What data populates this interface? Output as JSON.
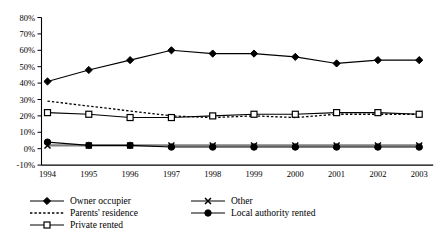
{
  "chart_data": {
    "type": "line",
    "title": "",
    "subtitle": "",
    "xlabel": "",
    "ylabel": "",
    "x": [
      "1994",
      "1995",
      "1996",
      "1997",
      "1998",
      "1999",
      "2000",
      "2001",
      "2002",
      "2003"
    ],
    "categories": [
      "1994",
      "1995",
      "1996",
      "1997",
      "1998",
      "1999",
      "2000",
      "2001",
      "2002",
      "2003"
    ],
    "ylim": [
      -10,
      80
    ],
    "ytick_labels": [
      "80%",
      "70%",
      "60%",
      "50%",
      "40%",
      "30%",
      "20%",
      "10%",
      "0%",
      "-10%"
    ],
    "ytick_values": [
      80,
      70,
      60,
      50,
      40,
      30,
      20,
      10,
      0,
      -10
    ],
    "grid": false,
    "legend_position": "bottom",
    "series": [
      {
        "name": "Owner occupier",
        "marker": "filled-diamond",
        "line_style": "solid",
        "color": "#000000",
        "values": [
          41,
          48,
          54,
          60,
          58,
          58,
          56,
          52,
          54,
          54
        ]
      },
      {
        "name": "Parents' residence",
        "marker": "none",
        "line_style": "dotted",
        "color": "#000000",
        "values": [
          29,
          26,
          23,
          20,
          19,
          20,
          19,
          21,
          21,
          21
        ]
      },
      {
        "name": "Private rented",
        "marker": "open-square",
        "line_style": "solid",
        "color": "#000000",
        "values": [
          22,
          21,
          19,
          19,
          20,
          21,
          21,
          22,
          22,
          21
        ]
      },
      {
        "name": "Other",
        "marker": "cross-x",
        "line_style": "solid",
        "color": "#808080",
        "values": [
          2,
          2,
          2,
          2,
          2,
          2,
          2,
          2,
          2,
          2
        ]
      },
      {
        "name": "Local authority rented",
        "marker": "filled-circle",
        "line_style": "solid",
        "color": "#000000",
        "values": [
          4,
          2,
          2,
          1,
          1,
          1,
          1,
          1,
          1,
          1
        ]
      }
    ]
  },
  "legend": {
    "items": [
      {
        "label": "Owner occupier",
        "marker": "filled-diamond",
        "line_style": "solid"
      },
      {
        "label": "Parents' residence",
        "marker": "none",
        "line_style": "dotted"
      },
      {
        "label": "Private rented",
        "marker": "open-square",
        "line_style": "solid"
      },
      {
        "label": "Other",
        "marker": "cross-x",
        "line_style": "solid"
      },
      {
        "label": "Local authority rented",
        "marker": "filled-circle",
        "line_style": "solid"
      }
    ]
  }
}
